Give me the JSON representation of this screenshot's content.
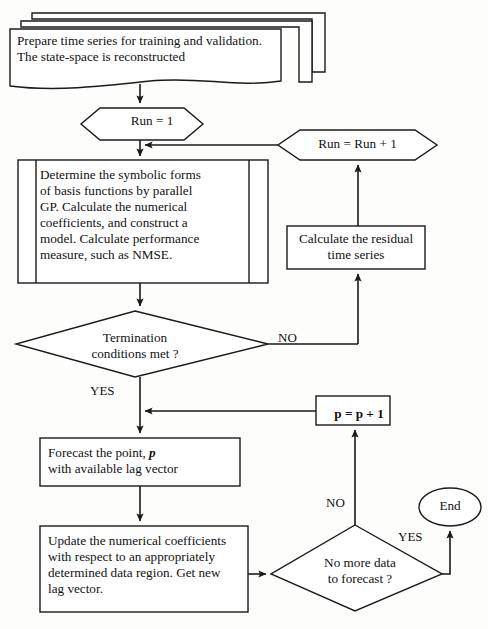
{
  "diagram": {
    "type": "flowchart",
    "stroke_color": "#1a1a1a",
    "fill_color": "#ffffff",
    "background_color": "#fdfdfb"
  },
  "nodes": {
    "input_documents": {
      "shape": "document-stack",
      "stack_count": 3,
      "line1": "Prepare time series for training and validation.",
      "line2": "The state-space is reconstructed"
    },
    "run_init": {
      "shape": "hexagon",
      "label": "Run = 1"
    },
    "gp_process": {
      "shape": "predefined-process",
      "line1": "Determine the symbolic forms",
      "line2": "of basis functions by parallel",
      "line3": "GP. Calculate the numerical",
      "line4": "coefficients, and construct a",
      "line5": "model. Calculate performance",
      "line6": "measure, such as NMSE."
    },
    "termination_decision": {
      "shape": "diamond",
      "line1": "Termination",
      "line2": "conditions met ?"
    },
    "residual_process": {
      "shape": "rectangle",
      "line1": "Calculate the residual",
      "line2": "time series"
    },
    "run_increment": {
      "shape": "hexagon",
      "label": "Run = Run + 1"
    },
    "forecast_process": {
      "shape": "rectangle",
      "line1_pre": "Forecast the point, ",
      "line1_var": "p",
      "line2": "with available lag vector"
    },
    "p_increment": {
      "shape": "rectangle",
      "label": "p = p + 1"
    },
    "update_process": {
      "shape": "rectangle",
      "line1": "Update the numerical coefficients",
      "line2": "with respect to an appropriately",
      "line3": "determined data region. Get new",
      "line4": "lag vector."
    },
    "no_more_data_decision": {
      "shape": "diamond",
      "line1": "No more data",
      "line2": "to forecast ?"
    },
    "end_terminator": {
      "shape": "ellipse",
      "label": "End"
    }
  },
  "edge_labels": {
    "termination_no": "NO",
    "termination_yes": "YES",
    "no_more_data_no": "NO",
    "no_more_data_yes": "YES"
  }
}
